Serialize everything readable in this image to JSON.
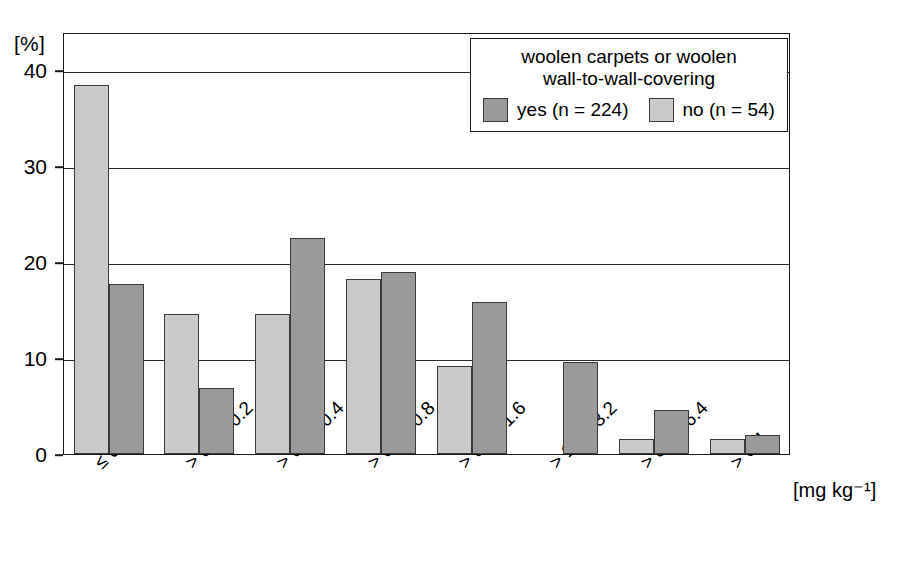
{
  "chart_data": {
    "type": "bar",
    "title": "",
    "xlabel": "[mg kg-1]",
    "xlabel_display": "[mg kg⁻¹]",
    "ylabel": "[%]",
    "ylim": [
      0,
      44
    ],
    "yticks": [
      0,
      10,
      20,
      30,
      40
    ],
    "grid": true,
    "legend_position": "top-right",
    "legend_title_line1": "woolen carpets or woolen",
    "legend_title_line2": "wall-to-wall-covering",
    "categories": [
      "≤ 0.1",
      "> 0.1 - 0.2",
      "> 0.2 - 0.4",
      "> 0.4 - 0.8",
      "> 0.8 - 1.6",
      "> 1.6 - 3.2",
      "> 3.2 - 6.4",
      "> 6.4"
    ],
    "series": [
      {
        "name": "no (n = 54)",
        "key": "no",
        "color": "#cacaca",
        "values": [
          38.5,
          14.6,
          14.6,
          18.3,
          9.2,
          0,
          1.6,
          1.6
        ]
      },
      {
        "name": "yes (n = 224)",
        "key": "yes",
        "color": "#9a9a9a",
        "values": [
          17.7,
          6.9,
          22.5,
          19.0,
          15.9,
          9.6,
          4.6,
          2.0
        ]
      }
    ],
    "series_draw_order": [
      "no",
      "yes"
    ]
  },
  "legend": {
    "title_line1": "woolen carpets or woolen",
    "title_line2": "wall-to-wall-covering",
    "items": [
      {
        "label": "yes (n = 224)",
        "swatch": "yes"
      },
      {
        "label": "no (n = 54)",
        "swatch": "no"
      }
    ]
  },
  "axes": {
    "y_unit": "[%]",
    "x_unit": "[mg kg⁻¹]",
    "ytick_labels": [
      "0",
      "10",
      "20",
      "30",
      "40"
    ]
  }
}
